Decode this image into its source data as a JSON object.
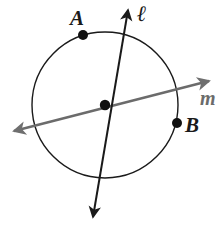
{
  "figure": {
    "width": 222,
    "height": 226,
    "background_color": "#ffffff"
  },
  "colors": {
    "circle_stroke": "#1a1a1a",
    "line_l_stroke": "#1a1a1a",
    "line_m_stroke": "#6b6b6b",
    "point_fill": "#111111",
    "label_color": "#1a1a1a",
    "label_m_color": "#6b6b6b"
  },
  "labels": {
    "point_a": "A",
    "point_b": "B",
    "line_l": "ℓ",
    "line_m": "m"
  },
  "geometry": {
    "circle": {
      "name": "circle",
      "cx": 105,
      "cy": 105,
      "r": 73,
      "stroke_width": 1.4
    },
    "center_point": {
      "name": "center-point",
      "cx": 105,
      "cy": 105,
      "r": 5.2
    },
    "point_a": {
      "name": "point-a",
      "cx": 83,
      "cy": 35,
      "r": 5.0
    },
    "point_b": {
      "name": "point-b",
      "cx": 177,
      "cy": 123,
      "r": 5.0
    },
    "line_l": {
      "name": "line-l",
      "x1": 128,
      "y1": 10,
      "x2": 93,
      "y2": 217,
      "stroke_width": 2.0,
      "arrow_start": true,
      "arrow_end": true
    },
    "line_m": {
      "name": "line-m",
      "x1": 14,
      "y1": 131,
      "x2": 209,
      "y2": 81,
      "stroke_width": 2.4,
      "arrow_start": true,
      "arrow_end": true
    }
  },
  "chart_data": {
    "type": "diagram",
    "elements": [
      {
        "kind": "circle",
        "label": "",
        "center": [
          105,
          105
        ],
        "radius": 73
      },
      {
        "kind": "point",
        "label": "A",
        "position": [
          83,
          35
        ],
        "on": "circle"
      },
      {
        "kind": "point",
        "label": "B",
        "position": [
          177,
          123
        ],
        "on": "circle"
      },
      {
        "kind": "point",
        "label": "",
        "position": [
          105,
          105
        ],
        "on": "center"
      },
      {
        "kind": "line",
        "label": "ℓ",
        "from": [
          128,
          10
        ],
        "to": [
          93,
          217
        ],
        "arrows": "both",
        "passes_through_center": true
      },
      {
        "kind": "line",
        "label": "m",
        "from": [
          14,
          131
        ],
        "to": [
          209,
          81
        ],
        "arrows": "both",
        "passes_through_center": true
      }
    ]
  }
}
